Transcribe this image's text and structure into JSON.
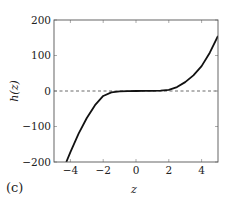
{
  "chart_data": {
    "type": "line",
    "title": "",
    "panel_label": "(c)",
    "xlabel": "z",
    "ylabel": "h(z)",
    "xlim": [
      -5,
      5
    ],
    "ylim": [
      -200,
      200
    ],
    "xticks": [
      -4,
      -2,
      0,
      2,
      4
    ],
    "xtick_labels": [
      "−4",
      "−2",
      "0",
      "2",
      "4"
    ],
    "yticks": [
      -200,
      -100,
      0,
      100,
      200
    ],
    "ytick_labels": [
      "−200",
      "−100",
      "0",
      "100",
      "200"
    ],
    "grid": false,
    "reference_line": {
      "y": 0,
      "style": "dashed"
    },
    "series": [
      {
        "name": "h(z)",
        "x": [
          -4.25,
          -4,
          -3.5,
          -3,
          -2.5,
          -2,
          -1.5,
          -1,
          -0.5,
          0,
          0.5,
          1,
          1.5,
          2,
          2.5,
          3,
          3.5,
          4,
          4.5,
          5
        ],
        "y": [
          -200,
          -172,
          -120,
          -76,
          -40,
          -14,
          -4,
          -1,
          -0.5,
          0,
          0.3,
          0.6,
          1,
          3,
          11,
          25,
          44,
          70,
          108,
          155
        ]
      }
    ]
  }
}
